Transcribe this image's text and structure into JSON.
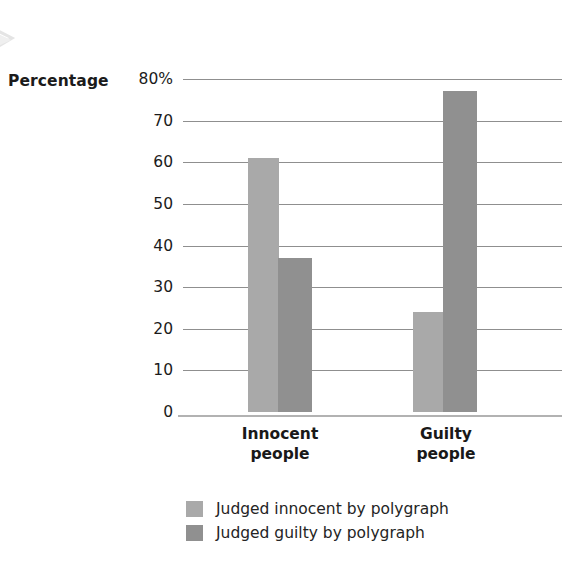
{
  "figure": {
    "y_axis_title": "Percentage"
  },
  "chart_data": {
    "type": "bar",
    "title": "",
    "subtitle": "",
    "xlabel": "",
    "ylabel": "Percentage",
    "ylim": [
      0,
      80
    ],
    "grid": true,
    "legend_position": "bottom",
    "categories": [
      "Innocent people",
      "Guilty people"
    ],
    "category_lines": [
      [
        "Innocent",
        "people"
      ],
      [
        "Guilty",
        "people"
      ]
    ],
    "yticks": [
      0,
      10,
      20,
      30,
      40,
      50,
      60,
      70,
      80
    ],
    "ytick_labels": [
      "0",
      "10",
      "20",
      "30",
      "40",
      "50",
      "60",
      "70",
      "80%"
    ],
    "series": [
      {
        "name": "Judged innocent by polygraph",
        "color": "#a9a9a9",
        "values": [
          61,
          24
        ]
      },
      {
        "name": "Judged guilty by polygraph",
        "color": "#909090",
        "values": [
          37,
          77
        ]
      }
    ]
  },
  "legend": {
    "items": [
      {
        "label": "Judged innocent by polygraph",
        "color": "#a9a9a9"
      },
      {
        "label": "Judged guilty by polygraph",
        "color": "#909090"
      }
    ]
  },
  "colors": {
    "series_light": "#a9a9a9",
    "series_dark": "#909090",
    "gridline": "#8f8f8f",
    "frame": "#b9b9b9",
    "text": "#1b1b1b",
    "background": "#ffffff"
  }
}
